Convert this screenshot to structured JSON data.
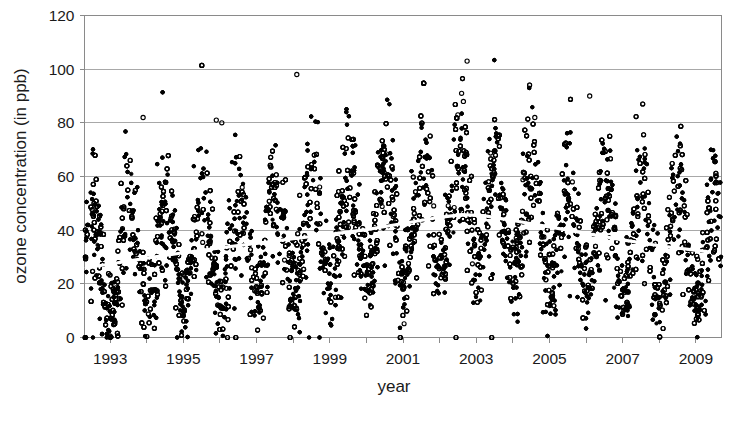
{
  "chart_data": {
    "type": "scatter",
    "title": "",
    "xlabel": "year",
    "ylabel": "ozone concentration (in ppb)",
    "xlim": [
      1992.3,
      2009.7
    ],
    "ylim": [
      0,
      120
    ],
    "xticks": [
      1993,
      1995,
      1997,
      1999,
      2001,
      2003,
      2005,
      2007,
      2009
    ],
    "xtick_labels": [
      "1993",
      "1995",
      "1997",
      "1999",
      "2001",
      "2003",
      "2005",
      "2007",
      "2009"
    ],
    "x_minor_tick_interval": 1,
    "yticks": [
      0,
      20,
      40,
      60,
      80,
      100,
      120
    ],
    "ytick_labels": [
      "0",
      "20",
      "40",
      "60",
      "80",
      "100",
      "120"
    ],
    "grid": "horizontal",
    "legend": "none",
    "marker": "open-circle",
    "marker_color": "#000000",
    "point_count_approx": 5800,
    "series": [
      {
        "name": "ozone measurements",
        "marker": "open-circle",
        "seasonal_cycle": {
          "period_years": 1.0,
          "summer_peak_ppb": 62,
          "winter_trough_ppb": 16,
          "spread_ppb": 14,
          "zero_floor_records": true
        }
      },
      {
        "name": "trend",
        "style": "white-line",
        "points": [
          {
            "x": 1992.35,
            "y": 26.0
          },
          {
            "x": 1993.0,
            "y": 27.4
          },
          {
            "x": 1994.0,
            "y": 29.6
          },
          {
            "x": 1995.0,
            "y": 31.6
          },
          {
            "x": 1996.0,
            "y": 33.4
          },
          {
            "x": 1997.0,
            "y": 35.1
          },
          {
            "x": 1998.0,
            "y": 36.8
          },
          {
            "x": 1999.0,
            "y": 38.4
          },
          {
            "x": 2000.0,
            "y": 40.2
          },
          {
            "x": 2001.0,
            "y": 42.5
          },
          {
            "x": 2002.0,
            "y": 44.8
          },
          {
            "x": 2002.6,
            "y": 45.8
          },
          {
            "x": 2003.2,
            "y": 45.4
          },
          {
            "x": 2004.0,
            "y": 43.6
          },
          {
            "x": 2005.0,
            "y": 41.2
          },
          {
            "x": 2006.0,
            "y": 38.8
          },
          {
            "x": 2007.0,
            "y": 36.4
          },
          {
            "x": 2008.0,
            "y": 34.2
          },
          {
            "x": 2009.3,
            "y": 32.0
          }
        ]
      }
    ],
    "notable_outliers": [
      {
        "x": 1998.1,
        "y": 98
      },
      {
        "x": 2002.75,
        "y": 103
      },
      {
        "x": 2002.6,
        "y": 91
      },
      {
        "x": 2002.65,
        "y": 88
      },
      {
        "x": 2006.1,
        "y": 90
      },
      {
        "x": 1995.9,
        "y": 81
      },
      {
        "x": 1993.9,
        "y": 82
      },
      {
        "x": 2004.6,
        "y": 82
      },
      {
        "x": 2002.5,
        "y": 83
      },
      {
        "x": 1996.05,
        "y": 80
      }
    ]
  },
  "axes": {
    "x_axis_title": "year",
    "y_axis_title": "ozone concentration (in ppb)"
  },
  "colors": {
    "background": "#ffffff",
    "gridline": "#a8a8a8",
    "axis": "#8a8a8a",
    "marker": "#000000",
    "trend": "#ffffff",
    "text": "#1a1a1a"
  }
}
